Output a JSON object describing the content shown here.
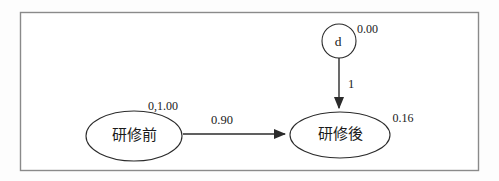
{
  "diagram": {
    "kind": "sem-path-diagram",
    "background_color": "#fdfdfd",
    "frame_color": "#8a8a8a",
    "line_color": "#2b2b2b",
    "nodes": {
      "error": {
        "shape": "circle",
        "label": "d",
        "param_label": "0.00"
      },
      "pre": {
        "shape": "ellipse",
        "label": "研修前",
        "param_label": "0,1.00"
      },
      "post": {
        "shape": "ellipse",
        "label": "研修後",
        "param_label": "0.16"
      }
    },
    "edges": {
      "error_to_post": {
        "from": "d",
        "to": "研修後",
        "weight_label": "1"
      },
      "pre_to_post": {
        "from": "研修前",
        "to": "研修後",
        "weight_label": "0.90"
      }
    }
  }
}
